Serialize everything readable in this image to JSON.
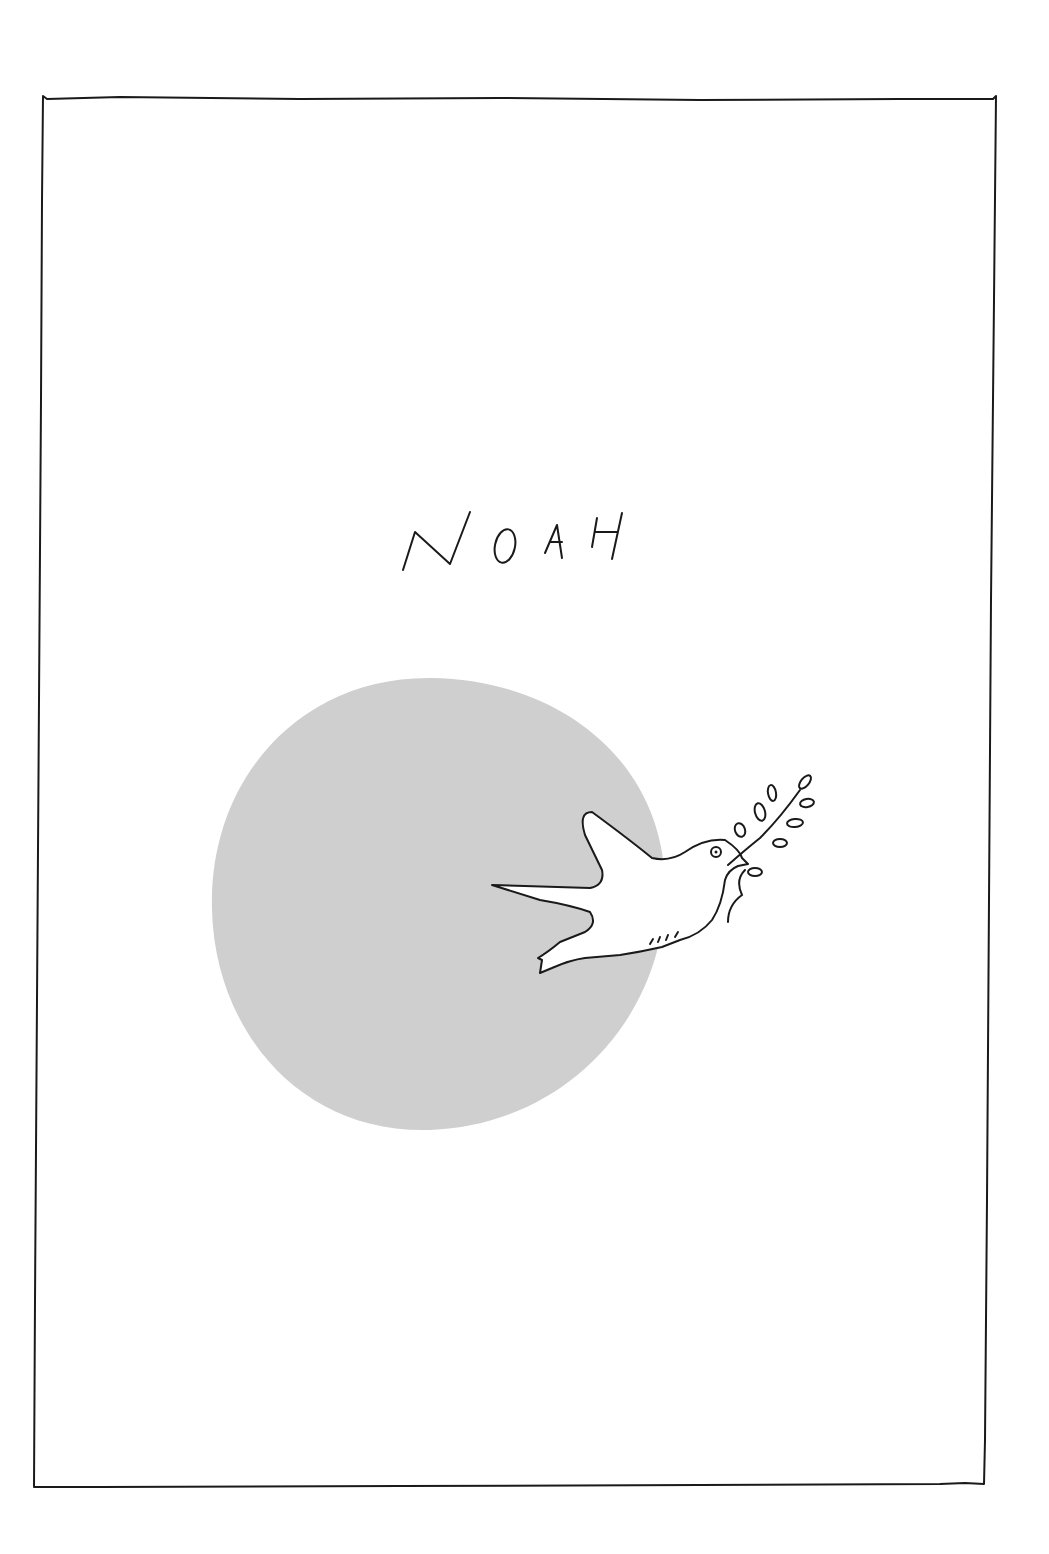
{
  "page": {
    "title": "NOAH",
    "illustration": {
      "subject": "dove-with-olive-branch",
      "background_circle_color": "#cfcfcf",
      "line_color": "#1a1a1a",
      "paper_color": "#ffffff"
    }
  }
}
